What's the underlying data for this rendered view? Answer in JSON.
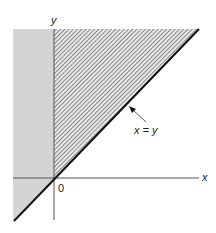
{
  "diagram": {
    "axes": {
      "x_label": "x",
      "y_label": "y",
      "origin_label": "0"
    },
    "line": {
      "label": "x = y",
      "equation": "x = y"
    },
    "regions": [
      {
        "name": "left-shaded-region",
        "style": "gray-fill",
        "description": "x < 0 region"
      },
      {
        "name": "hatched-region",
        "style": "diagonal-hatch",
        "description": "region above line y = x, with x > 0"
      }
    ],
    "colors": {
      "gray_fill": "#d4d4d4",
      "hatch": "#555555",
      "line": "#111111",
      "axis": "#555555"
    }
  }
}
